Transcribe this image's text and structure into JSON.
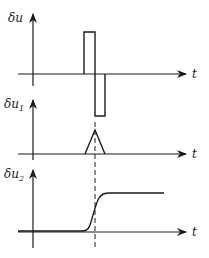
{
  "diagram": {
    "panels": [
      {
        "id": "delta-u",
        "y_label": "δu",
        "y_sub": "",
        "x_label": "t",
        "signal": "rectangular doublet: positive pulse followed by negative pulse"
      },
      {
        "id": "delta-u1",
        "y_label": "δu",
        "y_sub": "1",
        "x_label": "t",
        "signal": "triangular pulse"
      },
      {
        "id": "delta-u2",
        "y_label": "δu",
        "y_sub": "2",
        "x_label": "t",
        "signal": "smooth step (sigmoid)"
      }
    ],
    "marker": "dashed vertical line at time of sign reversal / peak"
  }
}
